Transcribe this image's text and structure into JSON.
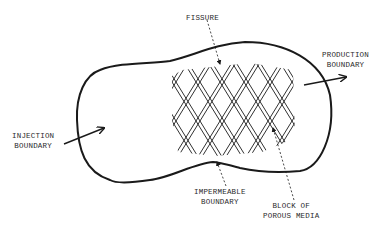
{
  "diagram": {
    "type": "schematic",
    "labels": {
      "fissure": "FISSURE",
      "production_boundary": [
        "PRODUCTION",
        "BOUNDARY"
      ],
      "injection_boundary": [
        "INJECTION",
        "BOUNDARY"
      ],
      "impermeable_boundary": [
        "IMPERMEABLE",
        "BOUNDARY"
      ],
      "porous_block": [
        "BLOCK OF",
        "POROUS MEDIA"
      ]
    },
    "colors": {
      "ink": "#1a1a1a",
      "background": "#ffffff"
    },
    "arrows": [
      {
        "name": "injection-arrow",
        "direction": "inward"
      },
      {
        "name": "production-arrow",
        "direction": "outward"
      }
    ]
  }
}
